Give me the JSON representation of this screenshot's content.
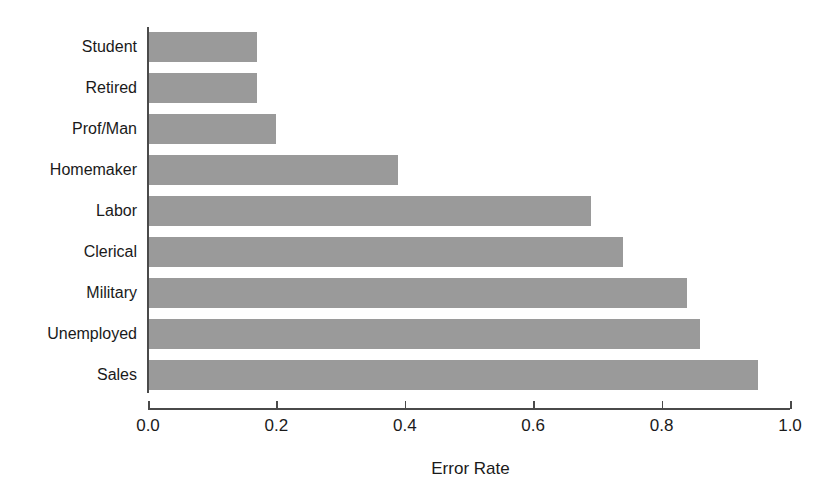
{
  "chart_data": {
    "type": "bar",
    "orientation": "horizontal",
    "title": "",
    "subtitle": "",
    "xlabel": "Error Rate",
    "ylabel": "",
    "categories": [
      "Student",
      "Retired",
      "Prof/Man",
      "Homemaker",
      "Labor",
      "Clerical",
      "Military",
      "Unemployed",
      "Sales"
    ],
    "values": [
      0.17,
      0.17,
      0.2,
      0.39,
      0.69,
      0.74,
      0.84,
      0.86,
      0.95
    ],
    "xlim": [
      0.0,
      1.0
    ],
    "xticks": [
      0.0,
      0.2,
      0.4,
      0.6,
      0.8,
      1.0
    ],
    "xtick_labels": [
      "0.0",
      "0.2",
      "0.4",
      "0.6",
      "0.8",
      "1.0"
    ],
    "grid": false,
    "legend": null,
    "bar_color": "#9a9a9a",
    "axis_color": "#4a4a4a",
    "background": "#ffffff"
  }
}
